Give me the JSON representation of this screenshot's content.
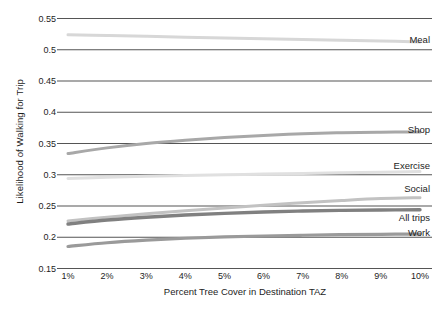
{
  "chart_data": {
    "type": "line",
    "title": "",
    "xlabel": "Percent Tree Cover in Destination TAZ",
    "ylabel": "Likelihood of Walking for Trip",
    "x": [
      1,
      2,
      3,
      4,
      5,
      6,
      7,
      8,
      9,
      10
    ],
    "xtick_labels": [
      "1%",
      "2%",
      "3%",
      "4%",
      "5%",
      "6%",
      "7%",
      "8%",
      "9%",
      "10%"
    ],
    "ytick_labels": [
      "0.55",
      "0.5",
      "0.45",
      "0.4",
      "0.35",
      "0.3",
      "0.25",
      "0.2",
      "0.15"
    ],
    "ytick_values": [
      0.55,
      0.5,
      0.45,
      0.4,
      0.35,
      0.3,
      0.25,
      0.2,
      0.15
    ],
    "ylim": [
      0.15,
      0.55
    ],
    "xlim": [
      1,
      10
    ],
    "grid": "horizontal",
    "legend_position": "right-inline-labels",
    "series": [
      {
        "name": "Meal",
        "color": "#d7d7d7",
        "width": 3.0,
        "label_y": 0.518,
        "values": [
          0.524,
          0.5228,
          0.5215,
          0.5202,
          0.519,
          0.5177,
          0.5164,
          0.5151,
          0.5139,
          0.5126
        ]
      },
      {
        "name": "Shop",
        "color": "#a8a8a8",
        "width": 3.0,
        "label_y": 0.3735,
        "values": [
          0.334,
          0.343,
          0.35,
          0.3553,
          0.3596,
          0.3629,
          0.3655,
          0.3672,
          0.3682,
          0.3685
        ]
      },
      {
        "name": "Exercise",
        "color": "#e0e0e0",
        "width": 3.0,
        "label_y": 0.3155,
        "values": [
          0.294,
          0.296,
          0.2976,
          0.299,
          0.3,
          0.3011,
          0.3021,
          0.3032,
          0.3042,
          0.3053
        ]
      },
      {
        "name": "Social",
        "color": "#c2c2c2",
        "width": 3.0,
        "label_y": 0.2795,
        "values": [
          0.2262,
          0.2322,
          0.2376,
          0.2425,
          0.247,
          0.2512,
          0.2552,
          0.2589,
          0.262,
          0.2634
        ]
      },
      {
        "name": "All trips",
        "color": "#808080",
        "width": 3.4,
        "label_y": 0.2325,
        "values": [
          0.2212,
          0.2275,
          0.232,
          0.2355,
          0.2382,
          0.2403,
          0.2419,
          0.243,
          0.2437,
          0.244
        ]
      },
      {
        "name": "Work",
        "color": "#9a9a9a",
        "width": 3.2,
        "label_y": 0.2085,
        "values": [
          0.1852,
          0.1912,
          0.1954,
          0.1984,
          0.2005,
          0.202,
          0.2032,
          0.2041,
          0.2047,
          0.2051
        ]
      }
    ],
    "gridline_color": "#555555",
    "axis_color": "#555555"
  }
}
